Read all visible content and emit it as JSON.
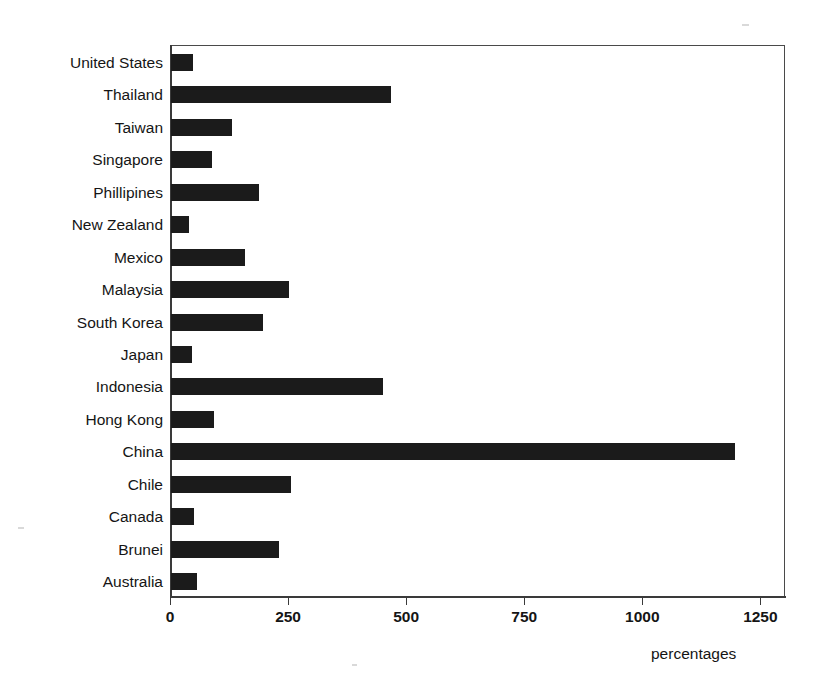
{
  "chart_data": {
    "type": "bar",
    "orientation": "horizontal",
    "title": "",
    "xlabel": "percentages",
    "ylabel": "",
    "xlim": [
      0,
      1300
    ],
    "xticks": [
      "0",
      "250",
      "500",
      "750",
      "1000",
      "1250"
    ],
    "xtick_values": [
      0,
      250,
      500,
      750,
      1000,
      1250
    ],
    "grid": false,
    "legend": null,
    "bar_color": "#1b1b1b",
    "frame_color": "#4a4a4a",
    "categories": [
      "United States",
      "Thailand",
      "Taiwan",
      "Singapore",
      "Phillipines",
      "New Zealand",
      "Mexico",
      "Malaysia",
      "South Korea",
      "Japan",
      "Indonesia",
      "Hong Kong",
      "China",
      "Chile",
      "Canada",
      "Brunei",
      "Australia"
    ],
    "values": [
      46,
      465,
      129,
      87,
      187,
      38,
      156,
      250,
      194,
      45,
      448,
      90,
      1194,
      254,
      48,
      229,
      56
    ]
  }
}
